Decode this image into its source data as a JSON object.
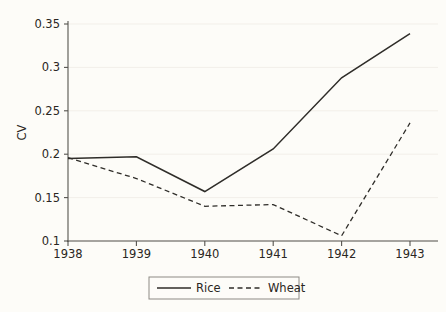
{
  "chart_data": {
    "type": "line",
    "title": "",
    "xlabel": "",
    "ylabel": "CV",
    "x": [
      1938,
      1939,
      1940,
      1941,
      1942,
      1943
    ],
    "categories": [
      "1938",
      "1939",
      "1940",
      "1941",
      "1942",
      "1943"
    ],
    "xlim": [
      1938,
      1943
    ],
    "ylim": [
      0.1,
      0.35
    ],
    "yticks": [
      0.1,
      0.15,
      0.2,
      0.25,
      0.3,
      0.35
    ],
    "ytick_labels": [
      "0.1",
      "0.15",
      "0.2",
      "0.25",
      "0.3",
      "0.35"
    ],
    "xticks": [
      1938,
      1939,
      1940,
      1941,
      1942,
      1943
    ],
    "xtick_labels": [
      "1938",
      "1939",
      "1940",
      "1941",
      "1942",
      "1943"
    ],
    "grid": true,
    "grid_axis": "y",
    "legend_position": "bottom-center",
    "series": [
      {
        "name": "Rice",
        "style": "solid",
        "color": "#2f2d29",
        "values": [
          0.195,
          0.197,
          0.157,
          0.206,
          0.288,
          0.339
        ]
      },
      {
        "name": "Wheat",
        "style": "dashed",
        "color": "#2f2d29",
        "values": [
          0.196,
          0.172,
          0.14,
          0.142,
          0.106,
          0.236
        ]
      }
    ]
  },
  "axes": {
    "y_axis_title": "CV"
  },
  "legend": {
    "entries": [
      {
        "label": "Rice"
      },
      {
        "label": "Wheat"
      }
    ]
  },
  "colors": {
    "background": "#fdfcf8",
    "grid": "#f2efe9",
    "axis": "#55534e",
    "line": "#2f2d29"
  }
}
